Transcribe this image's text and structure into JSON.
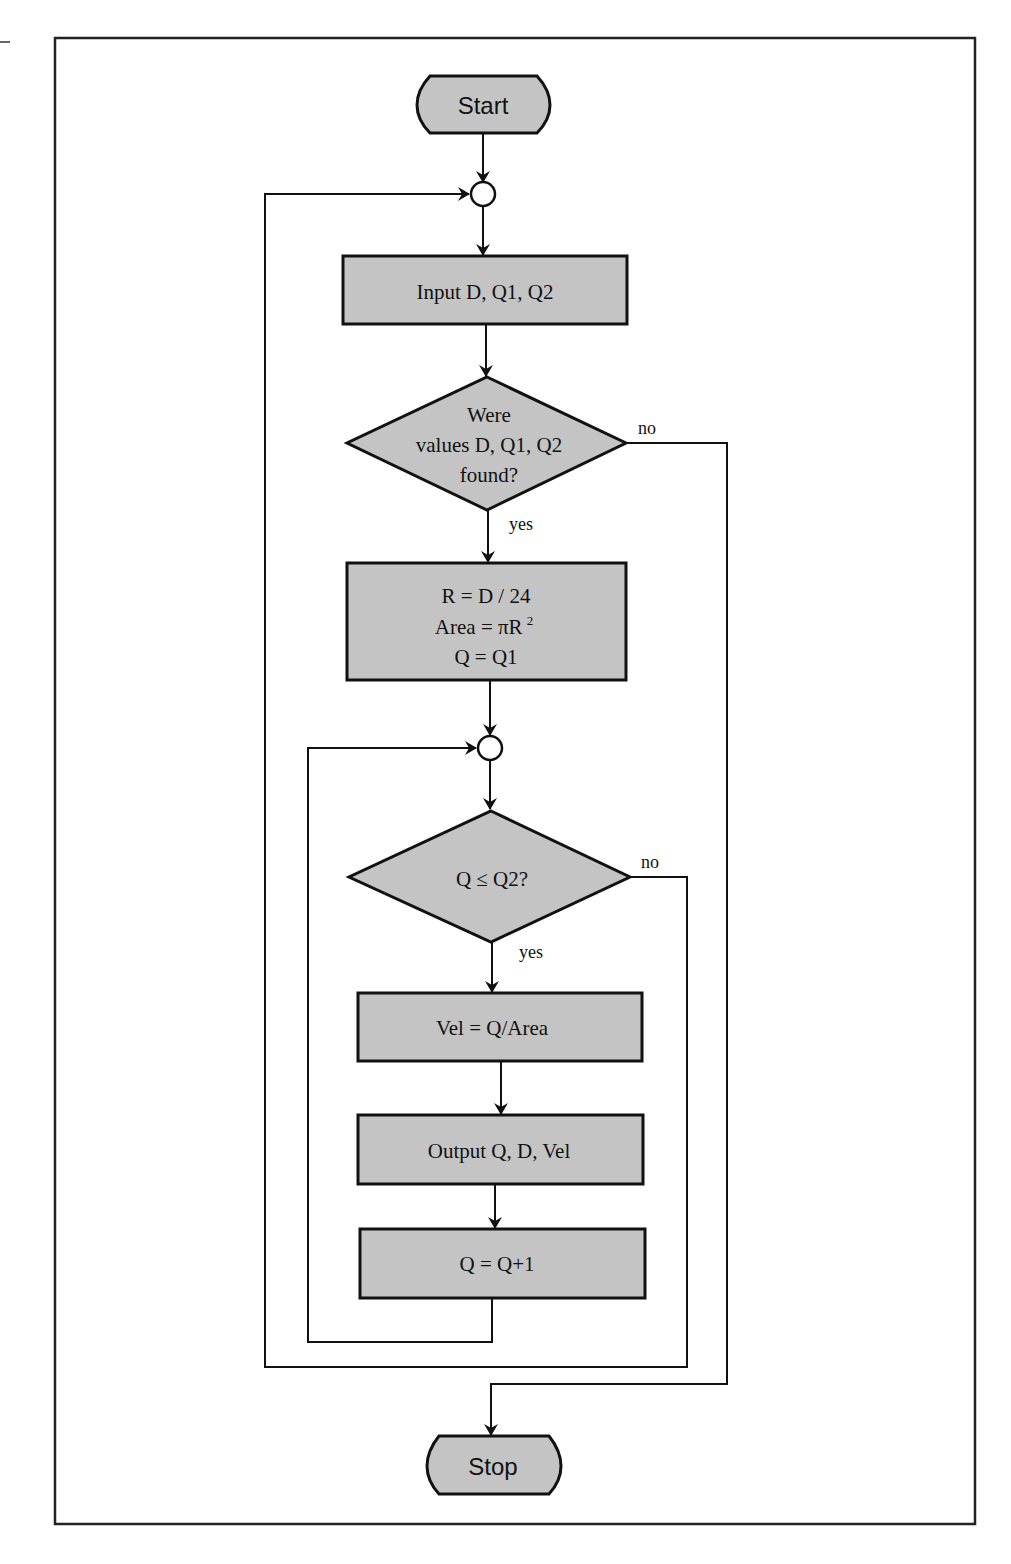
{
  "diagram": {
    "type": "flowchart",
    "colors": {
      "shape_fill": "#c4c4c4",
      "stroke": "#111111",
      "background": "#ffffff"
    },
    "terminals": {
      "start": "Start",
      "stop": "Stop"
    },
    "processes": {
      "input": "Input D, Q1, Q2",
      "init_line1": "R = D / 24",
      "init_line2": "Area = πR",
      "init_line2_sup": "2",
      "init_line3": "Q = Q1",
      "velocity": "Vel = Q/Area",
      "output": "Output Q, D, Vel",
      "increment": "Q = Q+1"
    },
    "decisions": {
      "found_line1": "Were",
      "found_line2": "values D, Q1, Q2",
      "found_line3": "found?",
      "compare": "Q ≤ Q2?"
    },
    "edge_labels": {
      "found_no": "no",
      "found_yes": "yes",
      "compare_no": "no",
      "compare_yes": "yes"
    }
  }
}
